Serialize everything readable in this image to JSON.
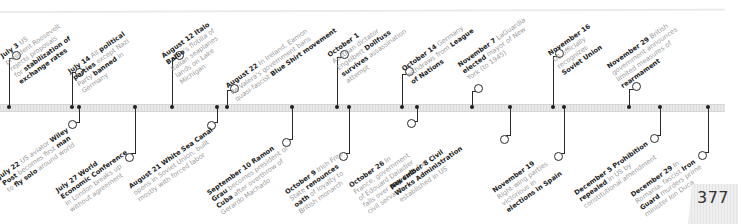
{
  "page_number": "377",
  "colors": {
    "bold_text": "#222222",
    "light_text": "#9a9a9a",
    "stem": "#2a2a2a",
    "bar": "#e0e0e0"
  },
  "events_above": [
    {
      "date": "July 3",
      "text": "US president Roosevelt rejects proposals for stabilization of exchange rates",
      "lines": [
        "US",
        "president Roosevelt",
        "rejects proposals",
        "for stabilization of",
        "exchange rates"
      ]
    },
    {
      "date": "July 14",
      "text": "All political parties except Nazi Party banned in Germany"
    },
    {
      "date": "August 12",
      "text": "Italo Balbo's flotilla of Italian seaplanes lands on Lake Michigan"
    },
    {
      "date": "August 22",
      "text": "In Ireland, Eamon de Valera's government bans quasi-fascist Blue Shirt movement"
    },
    {
      "date": "October 1",
      "text": "Austrian dictator Engelbert Dollfuss survives assassination attempt"
    },
    {
      "date": "October 14",
      "text": "Germany withdraws from League of Nations"
    },
    {
      "date": "November 7",
      "text": "LaGuardia elected mayor of New York (to 1945)"
    },
    {
      "date": "November 16",
      "text": "US officially recognizes Soviet Union"
    },
    {
      "date": "November 29",
      "text": "British government announces limited measures of rearmament"
    }
  ],
  "events_below": [
    {
      "date": "July 22",
      "text": "US aviator Wiley Post becomes first man to fly solo around world"
    },
    {
      "date": "July 27",
      "text": "World Economic Conference in London breaks up without agreement"
    },
    {
      "date": "August 21",
      "text": "White Sea Canal opens in Soviet Union, built mostly with forced labor"
    },
    {
      "date": "September 10",
      "text": "Ramon Grau becomes president of Cuba after overthrow of Gerardo Machado"
    },
    {
      "date": "October 9",
      "text": "Irish Free State renounces oath of loyalty to British monarch"
    },
    {
      "date": "October 26",
      "text": "In France, government of Edouard Daladier falls over pay cuts for civil servants"
    },
    {
      "date": "November 8",
      "text": "Civil Works Administration established in US"
    },
    {
      "date": "November 19",
      "text": "Right-wing parties victorious in elections in Spain"
    },
    {
      "date": "December 5",
      "text": "Prohibition repealed in US by constitutional amendment"
    },
    {
      "date": "December 29",
      "text": "In Romania, fascist Iron Guard murders prime minister Ion Duca"
    }
  ]
}
